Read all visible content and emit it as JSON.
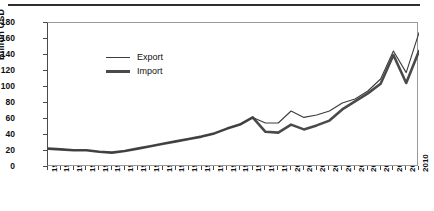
{
  "chart_data": {
    "type": "line",
    "title": "",
    "xlabel": "",
    "ylabel": "Billion USD",
    "ylim": [
      0,
      180
    ],
    "ytick_step": 20,
    "yticks": [
      180,
      160,
      140,
      120,
      100,
      80,
      60,
      40,
      20,
      0
    ],
    "grid": false,
    "legend_position": "top-left",
    "x": [
      1981,
      1982,
      1983,
      1984,
      1985,
      1986,
      1987,
      1988,
      1989,
      1990,
      1991,
      1992,
      1993,
      1994,
      1995,
      1996,
      1997,
      1998,
      1999,
      2000,
      2001,
      2002,
      2003,
      2004,
      2005,
      2006,
      2007,
      2008,
      2009,
      2010
    ],
    "categories": [
      "1981",
      "1982",
      "1983",
      "1984",
      "1985",
      "1986",
      "1987",
      "1988",
      "1989",
      "1990",
      "1991",
      "1992",
      "1993",
      "1994",
      "1995",
      "1996",
      "1997",
      "1998",
      "1999",
      "2000",
      "2001",
      "2002",
      "2003",
      "2004",
      "2005",
      "2006",
      "2007",
      "2008",
      "2009",
      "2010"
    ],
    "series": [
      {
        "name": "Export",
        "line_style": "thin",
        "color": "#3c3c3c",
        "values": [
          23,
          22,
          21,
          21,
          19,
          18,
          20,
          23,
          26,
          29,
          32,
          35,
          38,
          42,
          48,
          53,
          62,
          55,
          55,
          70,
          62,
          65,
          70,
          80,
          85,
          95,
          110,
          145,
          118,
          168
        ]
      },
      {
        "name": "Import",
        "line_style": "thick",
        "color": "#4a4a4a",
        "values": [
          23,
          22,
          21,
          21,
          19,
          18,
          20,
          23,
          26,
          29,
          32,
          35,
          38,
          42,
          48,
          53,
          62,
          44,
          43,
          53,
          47,
          52,
          58,
          72,
          82,
          92,
          104,
          140,
          105,
          145
        ]
      }
    ]
  },
  "legend": {
    "items": [
      {
        "label": "Export"
      },
      {
        "label": "Import"
      }
    ]
  },
  "axis": {
    "y_title": "Billion USD"
  },
  "colors": {
    "export_line": "#3c3c3c",
    "import_line": "#4a4a4a",
    "frame": "#9a9a9a",
    "text": "#111111",
    "top_rule": "#2e2e2e"
  }
}
